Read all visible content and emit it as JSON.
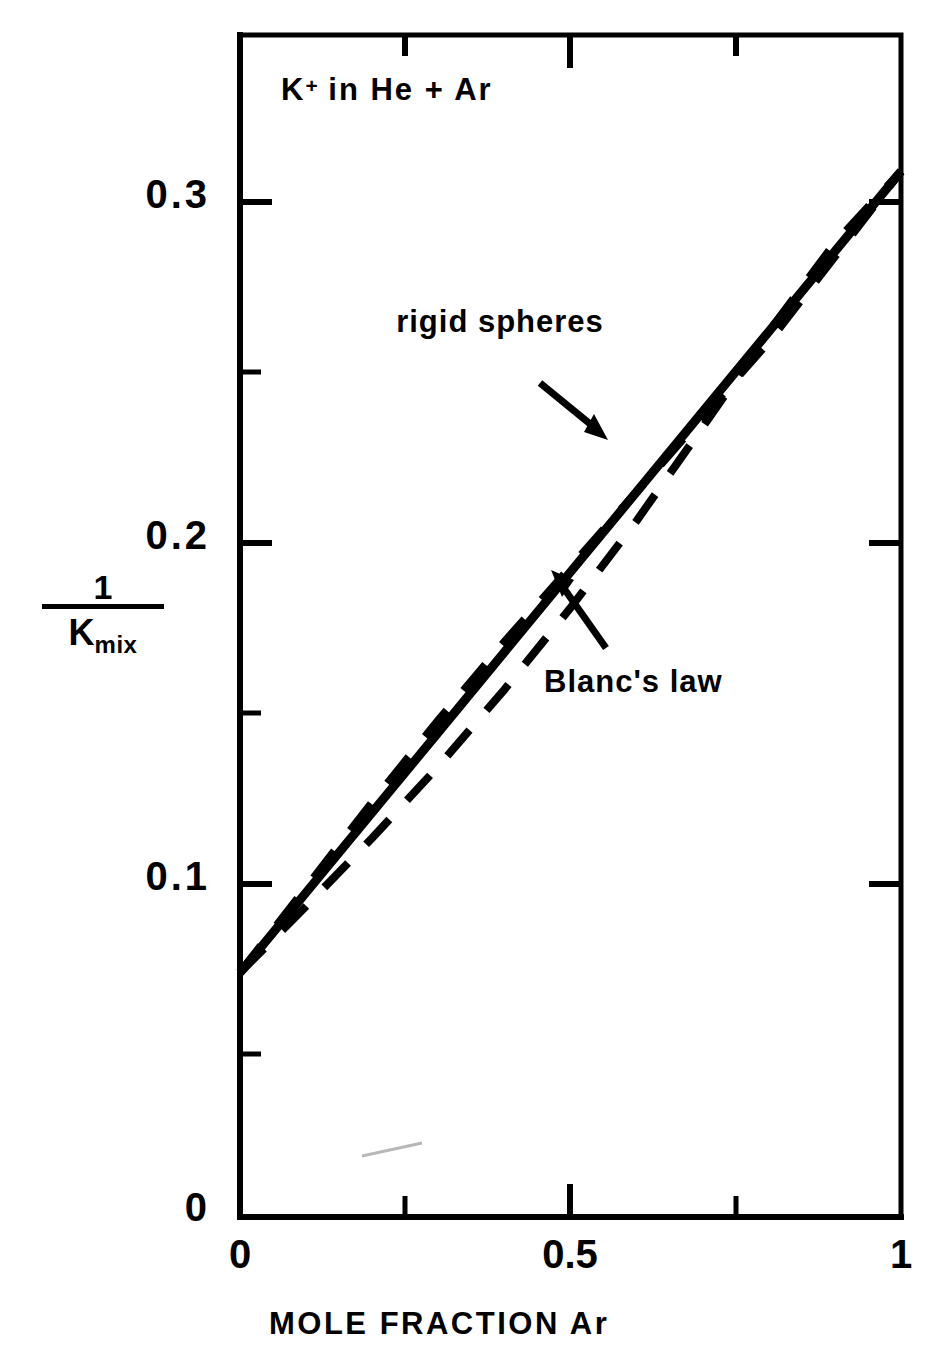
{
  "figure": {
    "plot_title": "K",
    "plot_title_superscript": "+",
    "plot_title_rest": " in He + Ar"
  },
  "axes": {
    "y_title_numerator": "1",
    "y_title_denominator_base": "K",
    "y_title_denominator_sub": "mix",
    "x_title": "MOLE FRACTION Ar",
    "y_tick_labels": [
      "0.3",
      "0.2",
      "0.1",
      "0"
    ],
    "x_tick_labels": [
      "0",
      "0.5",
      "1"
    ]
  },
  "annotations": {
    "rigid_spheres": "rigid\nspheres",
    "blancs_law": "Blanc's law"
  },
  "chart_data": {
    "type": "line",
    "title": "K+ in He + Ar",
    "xlabel": "MOLE FRACTION Ar",
    "ylabel": "1/K_mix",
    "xlim": [
      0,
      1
    ],
    "ylim": [
      0,
      0.36
    ],
    "x_ticks": [
      0,
      0.5,
      1
    ],
    "x_tick_labels": [
      "0",
      "0.5",
      "1"
    ],
    "x_minor_ticks": [
      0.25,
      0.75
    ],
    "y_ticks": [
      0,
      0.1,
      0.2,
      0.3
    ],
    "y_tick_labels": [
      "0",
      "0.1",
      "0.2",
      "0.3"
    ],
    "y_minor_ticks": [
      0.05,
      0.15,
      0.25,
      0.35
    ],
    "grid": false,
    "legend": "none",
    "series": [
      {
        "name": "rigid spheres",
        "style": "dashed",
        "color": "#000000",
        "x": [
          0.0,
          0.1,
          0.2,
          0.3,
          0.4,
          0.5,
          0.6,
          0.7,
          0.8,
          0.9,
          1.0
        ],
        "y": [
          0.074,
          0.099,
          0.124,
          0.148,
          0.171,
          0.193,
          0.215,
          0.237,
          0.259,
          0.284,
          0.309
        ]
      },
      {
        "name": "Blanc's law",
        "style": "solid",
        "color": "#000000",
        "x": [
          0.0,
          0.1,
          0.2,
          0.3,
          0.4,
          0.5,
          0.6,
          0.7,
          0.8,
          0.9,
          1.0
        ],
        "y": [
          0.074,
          0.0975,
          0.121,
          0.1445,
          0.168,
          0.1915,
          0.215,
          0.2385,
          0.262,
          0.2855,
          0.309
        ]
      },
      {
        "name": "lower bound",
        "style": "dashed",
        "color": "#000000",
        "x": [
          0.0,
          0.1,
          0.2,
          0.3,
          0.4,
          0.5,
          0.6,
          0.7,
          0.8,
          0.9,
          1.0
        ],
        "y": [
          0.074,
          0.0935,
          0.1135,
          0.1345,
          0.157,
          0.181,
          0.2065,
          0.234,
          0.262,
          0.288,
          0.309
        ]
      }
    ],
    "annotations": [
      {
        "text": "rigid spheres",
        "x": 0.33,
        "y": 0.262,
        "arrow_to_x": 0.42,
        "arrow_to_y": 0.232
      },
      {
        "text": "Blanc's law",
        "x": 0.6,
        "y": 0.152,
        "arrow_to_x": 0.525,
        "arrow_to_y": 0.196
      }
    ]
  }
}
